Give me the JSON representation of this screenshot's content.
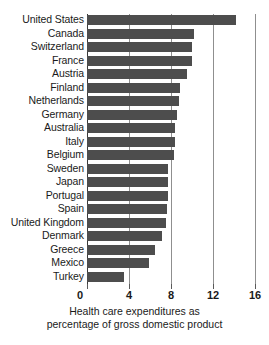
{
  "chart_data": {
    "type": "bar",
    "orientation": "horizontal",
    "title": "",
    "subtitle": "",
    "xlabel": "Health care expenditures as percentage of gross domestic product",
    "ylabel": "",
    "xlim": [
      0,
      16.19
    ],
    "xticks": [
      0,
      4,
      8,
      12,
      16
    ],
    "xtick_labels": [
      "0",
      "4",
      "8",
      "12",
      "16"
    ],
    "grid": true,
    "grid_axis": "x",
    "legend": null,
    "bar_color": "#4d4d4d",
    "categories": [
      "United States",
      "Canada",
      "Switzerland",
      "France",
      "Austria",
      "Finland",
      "Netherlands",
      "Germany",
      "Australia",
      "Italy",
      "Belgium",
      "Sweden",
      "Japan",
      "Portugal",
      "Spain",
      "United Kingdom",
      "Denmark",
      "Greece",
      "Mexico",
      "Turkey"
    ],
    "values": [
      14.2,
      10.2,
      10.0,
      10.0,
      9.5,
      8.9,
      8.8,
      8.6,
      8.4,
      8.4,
      8.3,
      7.7,
      7.7,
      7.7,
      7.6,
      7.5,
      7.1,
      6.5,
      5.9,
      3.5
    ]
  },
  "caption": {
    "line1": "Health care expenditures as",
    "line2": "percentage of gross domestic product"
  }
}
